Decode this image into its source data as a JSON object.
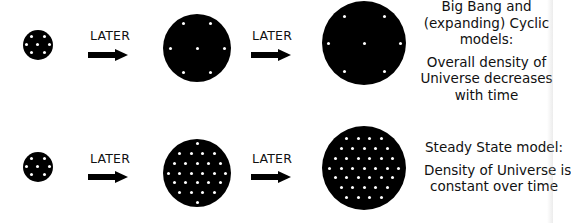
{
  "colors": {
    "background": "#ffffff",
    "circle": "#000000",
    "dot": "#ffffff",
    "text": "#111111"
  },
  "rows": [
    {
      "name": "expanding",
      "arrow_labels": [
        "LATER",
        "LATER"
      ],
      "circles": [
        {
          "stage": "early",
          "cx": 38,
          "cy": 45,
          "r": 15,
          "dot_count": 7
        },
        {
          "stage": "middle",
          "cx": 197,
          "cy": 48,
          "r": 34,
          "dot_count": 7
        },
        {
          "stage": "late",
          "cx": 364,
          "cy": 43,
          "r": 42,
          "dot_count": 7
        }
      ],
      "caption": {
        "heading_lines": [
          "Big Bang and",
          "(expanding) Cyclic",
          "models:"
        ],
        "body_lines": [
          "Overall density of",
          "Universe decreases",
          "with time"
        ]
      }
    },
    {
      "name": "steady-state",
      "arrow_labels": [
        "LATER",
        "LATER"
      ],
      "circles": [
        {
          "stage": "early",
          "cx": 38,
          "cy": 167,
          "r": 15,
          "dot_count": 7
        },
        {
          "stage": "middle",
          "cx": 197,
          "cy": 173,
          "r": 34,
          "dot_count": 30
        },
        {
          "stage": "late",
          "cx": 364,
          "cy": 168,
          "r": 42,
          "dot_count": 46
        }
      ],
      "caption": {
        "heading_lines": [
          "Steady State model:"
        ],
        "body_lines": [
          "Density of Universe is",
          "constant over time"
        ]
      }
    }
  ]
}
